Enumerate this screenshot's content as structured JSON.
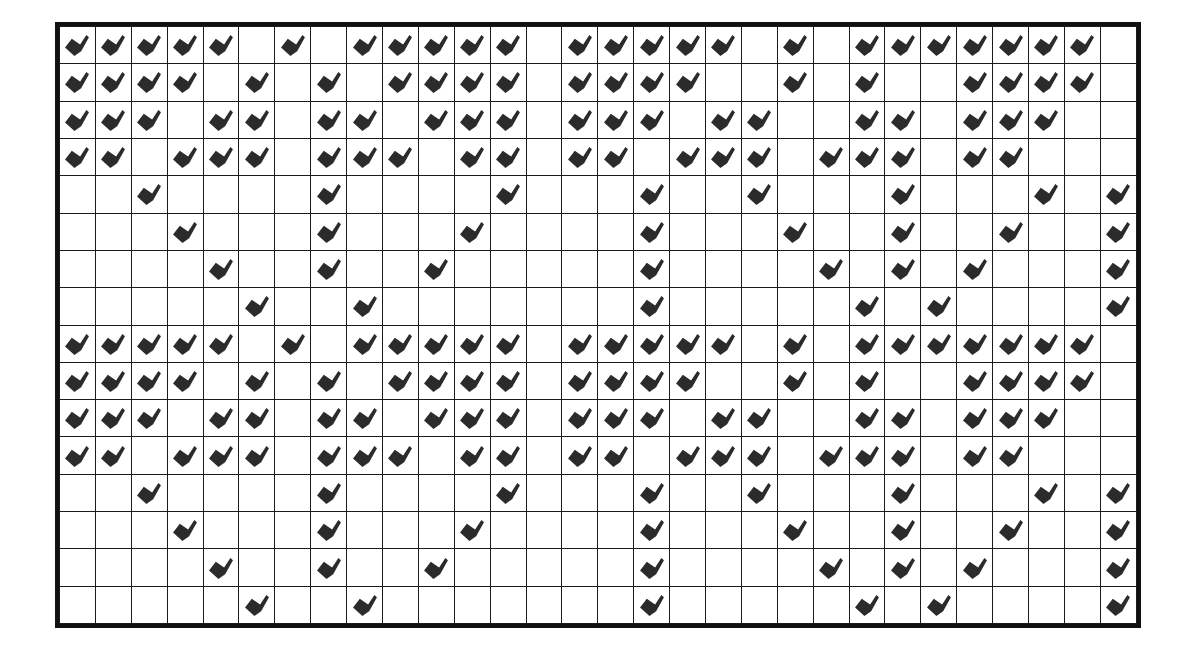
{
  "figure": {
    "glyph_name": "checkmark-glyph",
    "glyph_color": "#2b2b2b",
    "grid_line_color": "#1a1a1a",
    "border_color": "#111111",
    "background_color": "#ffffff",
    "columns": 30,
    "rows": 16
  },
  "chart_data": {
    "type": "heatmap",
    "xlabel": "",
    "ylabel": "",
    "categories": [
      1,
      2,
      3,
      4,
      5,
      6,
      7,
      8,
      9,
      10,
      11,
      12,
      13,
      14,
      15,
      16,
      17,
      18,
      19,
      20,
      21,
      22,
      23,
      24,
      25,
      26,
      27,
      28,
      29,
      30
    ],
    "row_labels": [
      1,
      2,
      3,
      4,
      5,
      6,
      7,
      8,
      9,
      10,
      11,
      12,
      13,
      14,
      15,
      16
    ],
    "legend": [],
    "grid": true,
    "value_meaning": {
      "1": "checkmark glyph present",
      "0": "empty cell"
    },
    "matrix": [
      [
        1,
        1,
        1,
        1,
        1,
        0,
        1,
        0,
        1,
        1,
        1,
        1,
        1,
        0,
        1,
        1,
        1,
        1,
        1,
        0,
        1,
        0,
        1,
        1,
        1,
        1,
        1,
        1,
        1,
        0
      ],
      [
        1,
        1,
        1,
        1,
        0,
        1,
        0,
        1,
        0,
        1,
        1,
        1,
        1,
        0,
        1,
        1,
        1,
        1,
        0,
        0,
        1,
        0,
        1,
        0,
        0,
        1,
        1,
        1,
        1,
        0
      ],
      [
        1,
        1,
        1,
        0,
        1,
        1,
        0,
        1,
        1,
        0,
        1,
        1,
        1,
        0,
        1,
        1,
        1,
        0,
        1,
        1,
        0,
        0,
        1,
        1,
        0,
        1,
        1,
        1,
        0,
        0
      ],
      [
        1,
        1,
        0,
        1,
        1,
        1,
        0,
        1,
        1,
        1,
        0,
        1,
        1,
        0,
        1,
        1,
        0,
        1,
        1,
        1,
        0,
        1,
        1,
        1,
        0,
        1,
        1,
        0,
        0,
        0
      ],
      [
        0,
        0,
        1,
        0,
        0,
        0,
        0,
        1,
        0,
        0,
        0,
        0,
        1,
        0,
        0,
        0,
        1,
        0,
        0,
        1,
        0,
        0,
        0,
        1,
        0,
        0,
        0,
        1,
        0,
        1
      ],
      [
        0,
        0,
        0,
        1,
        0,
        0,
        0,
        1,
        0,
        0,
        0,
        1,
        0,
        0,
        0,
        0,
        1,
        0,
        0,
        0,
        1,
        0,
        0,
        1,
        0,
        0,
        1,
        0,
        0,
        1
      ],
      [
        0,
        0,
        0,
        0,
        1,
        0,
        0,
        1,
        0,
        0,
        1,
        0,
        0,
        0,
        0,
        0,
        1,
        0,
        0,
        0,
        0,
        1,
        0,
        1,
        0,
        1,
        0,
        0,
        0,
        1
      ],
      [
        0,
        0,
        0,
        0,
        0,
        1,
        0,
        0,
        1,
        0,
        0,
        0,
        0,
        0,
        0,
        0,
        1,
        0,
        0,
        0,
        0,
        0,
        1,
        0,
        1,
        0,
        0,
        0,
        0,
        1
      ],
      [
        1,
        1,
        1,
        1,
        1,
        0,
        1,
        0,
        1,
        1,
        1,
        1,
        1,
        0,
        1,
        1,
        1,
        1,
        1,
        0,
        1,
        0,
        1,
        1,
        1,
        1,
        1,
        1,
        1,
        0
      ],
      [
        1,
        1,
        1,
        1,
        0,
        1,
        0,
        1,
        0,
        1,
        1,
        1,
        1,
        0,
        1,
        1,
        1,
        1,
        0,
        0,
        1,
        0,
        1,
        0,
        0,
        1,
        1,
        1,
        1,
        0
      ],
      [
        1,
        1,
        1,
        0,
        1,
        1,
        0,
        1,
        1,
        0,
        1,
        1,
        1,
        0,
        1,
        1,
        1,
        0,
        1,
        1,
        0,
        0,
        1,
        1,
        0,
        1,
        1,
        1,
        0,
        0
      ],
      [
        1,
        1,
        0,
        1,
        1,
        1,
        0,
        1,
        1,
        1,
        0,
        1,
        1,
        0,
        1,
        1,
        0,
        1,
        1,
        1,
        0,
        1,
        1,
        1,
        0,
        1,
        1,
        0,
        0,
        0
      ],
      [
        0,
        0,
        1,
        0,
        0,
        0,
        0,
        1,
        0,
        0,
        0,
        0,
        1,
        0,
        0,
        0,
        1,
        0,
        0,
        1,
        0,
        0,
        0,
        1,
        0,
        0,
        0,
        1,
        0,
        1
      ],
      [
        0,
        0,
        0,
        1,
        0,
        0,
        0,
        1,
        0,
        0,
        0,
        1,
        0,
        0,
        0,
        0,
        1,
        0,
        0,
        0,
        1,
        0,
        0,
        1,
        0,
        0,
        1,
        0,
        0,
        1
      ],
      [
        0,
        0,
        0,
        0,
        1,
        0,
        0,
        1,
        0,
        0,
        1,
        0,
        0,
        0,
        0,
        0,
        1,
        0,
        0,
        0,
        0,
        1,
        0,
        1,
        0,
        1,
        0,
        0,
        0,
        1
      ],
      [
        0,
        0,
        0,
        0,
        0,
        1,
        0,
        0,
        1,
        0,
        0,
        0,
        0,
        0,
        0,
        0,
        1,
        0,
        0,
        0,
        0,
        0,
        1,
        0,
        1,
        0,
        0,
        0,
        0,
        1
      ]
    ]
  }
}
